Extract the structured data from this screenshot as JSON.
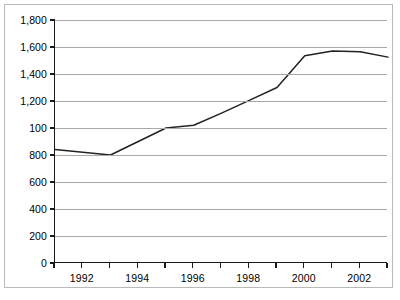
{
  "chart_data": {
    "type": "line",
    "title": "",
    "subtitle": "",
    "xlabel": "",
    "ylabel": "",
    "x": [
      1991,
      1992,
      1993,
      1994,
      1995,
      1996,
      1997,
      1998,
      1999,
      2000,
      2001,
      2002,
      2003
    ],
    "values": [
      840,
      820,
      800,
      900,
      1000,
      1020,
      1110,
      1205,
      1300,
      1535,
      1570,
      1565,
      1525
    ],
    "series": [
      {
        "name": "",
        "values": [
          840,
          820,
          800,
          900,
          1000,
          1020,
          1110,
          1205,
          1300,
          1535,
          1570,
          1565,
          1525
        ]
      }
    ],
    "xlim": [
      1991,
      2003
    ],
    "ylim": [
      0,
      1800
    ],
    "y_ticks": [
      0,
      200,
      400,
      600,
      800,
      1000,
      1200,
      1400,
      1600,
      1800
    ],
    "y_tick_labels": [
      "0",
      "200",
      "400",
      "600",
      "800",
      "100",
      "1,200",
      "1,400",
      "1,600",
      "1,800"
    ],
    "x_ticks": [
      1991,
      1992,
      1993,
      1994,
      1995,
      1996,
      1997,
      1998,
      1999,
      2000,
      2001,
      2002,
      2003
    ],
    "x_tick_labels": [
      "",
      "1992",
      "",
      "1994",
      "",
      "1996",
      "",
      "1998",
      "",
      "2000",
      "",
      "2002",
      ""
    ],
    "grid": true,
    "grid_axis": "y",
    "legend": false,
    "legend_position": "none",
    "annotations": [],
    "colors": {
      "line": "#222222",
      "gridline": "#a8a8a8",
      "axis": "#1a1a1a",
      "frame": "#b9b9b9",
      "background": "#ffffff",
      "text": "#000000"
    }
  }
}
